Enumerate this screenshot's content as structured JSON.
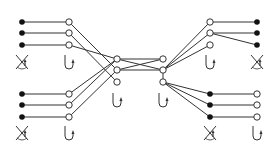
{
  "diagram": {
    "type": "network-graph",
    "colors": {
      "edge": "#333333",
      "filled_node": "#111111",
      "open_node_fill": "#ffffff",
      "open_node_stroke": "#333333",
      "icon": "#333333"
    },
    "nodes": [
      {
        "id": "L1a",
        "x": 22,
        "y": 22,
        "kind": "filled"
      },
      {
        "id": "L1b",
        "x": 22,
        "y": 33,
        "kind": "filled"
      },
      {
        "id": "L1c",
        "x": 22,
        "y": 45,
        "kind": "filled"
      },
      {
        "id": "L2a",
        "x": 69,
        "y": 22,
        "kind": "open"
      },
      {
        "id": "L2b",
        "x": 69,
        "y": 33,
        "kind": "open"
      },
      {
        "id": "L2c",
        "x": 69,
        "y": 45,
        "kind": "open"
      },
      {
        "id": "L3a",
        "x": 22,
        "y": 94,
        "kind": "filled"
      },
      {
        "id": "L3b",
        "x": 22,
        "y": 105,
        "kind": "filled"
      },
      {
        "id": "L3c",
        "x": 22,
        "y": 117,
        "kind": "filled"
      },
      {
        "id": "L4a",
        "x": 69,
        "y": 94,
        "kind": "open"
      },
      {
        "id": "L4b",
        "x": 69,
        "y": 105,
        "kind": "open"
      },
      {
        "id": "L4c",
        "x": 69,
        "y": 117,
        "kind": "open"
      },
      {
        "id": "CLa",
        "x": 117,
        "y": 59,
        "kind": "open"
      },
      {
        "id": "CLb",
        "x": 117,
        "y": 70,
        "kind": "open"
      },
      {
        "id": "CLc",
        "x": 117,
        "y": 82,
        "kind": "open"
      },
      {
        "id": "CRa",
        "x": 163,
        "y": 59,
        "kind": "open"
      },
      {
        "id": "CRb",
        "x": 163,
        "y": 70,
        "kind": "open"
      },
      {
        "id": "CRc",
        "x": 163,
        "y": 82,
        "kind": "open"
      },
      {
        "id": "R1a",
        "x": 210,
        "y": 22,
        "kind": "open"
      },
      {
        "id": "R1b",
        "x": 210,
        "y": 33,
        "kind": "open"
      },
      {
        "id": "R1c",
        "x": 210,
        "y": 45,
        "kind": "open"
      },
      {
        "id": "R2a",
        "x": 257,
        "y": 22,
        "kind": "filled"
      },
      {
        "id": "R2b",
        "x": 257,
        "y": 33,
        "kind": "filled"
      },
      {
        "id": "R2c",
        "x": 257,
        "y": 45,
        "kind": "filled"
      },
      {
        "id": "R3a",
        "x": 210,
        "y": 94,
        "kind": "filled"
      },
      {
        "id": "R3b",
        "x": 210,
        "y": 105,
        "kind": "filled"
      },
      {
        "id": "R3c",
        "x": 210,
        "y": 117,
        "kind": "filled"
      },
      {
        "id": "R4a",
        "x": 257,
        "y": 94,
        "kind": "open"
      },
      {
        "id": "R4b",
        "x": 257,
        "y": 105,
        "kind": "open"
      },
      {
        "id": "R4c",
        "x": 257,
        "y": 117,
        "kind": "open"
      }
    ],
    "edges": [
      [
        "L1a",
        "L2a"
      ],
      [
        "L1b",
        "L2b"
      ],
      [
        "L1c",
        "L2c"
      ],
      [
        "L3a",
        "L4a"
      ],
      [
        "L3b",
        "L4b"
      ],
      [
        "L3c",
        "L4c"
      ],
      [
        "L2a",
        "CLb"
      ],
      [
        "L2b",
        "CLc"
      ],
      [
        "L2c",
        "CLa"
      ],
      [
        "L4a",
        "CLa"
      ],
      [
        "L4b",
        "CLa"
      ],
      [
        "L4c",
        "CLb"
      ],
      [
        "CLa",
        "CRa"
      ],
      [
        "CLa",
        "CRb"
      ],
      [
        "CLb",
        "CRa"
      ],
      [
        "CLb",
        "CRb"
      ],
      [
        "CRb",
        "R1a"
      ],
      [
        "CRb",
        "R1b"
      ],
      [
        "CRb",
        "R1c"
      ],
      [
        "R1a",
        "R2a"
      ],
      [
        "R1b",
        "R2b"
      ],
      [
        "R1b",
        "R2c"
      ],
      [
        "CRc",
        "R3a"
      ],
      [
        "CRc",
        "R3b"
      ],
      [
        "CRc",
        "R3c"
      ],
      [
        "R3a",
        "R4a"
      ],
      [
        "R3b",
        "R4b"
      ],
      [
        "R3c",
        "R4c"
      ],
      [
        "CRb",
        "CRc"
      ]
    ],
    "icons": [
      {
        "name": "crossed-out-icon",
        "x": 22,
        "y": 62
      },
      {
        "name": "hook-return-icon",
        "x": 69,
        "y": 62
      },
      {
        "name": "crossed-out-icon",
        "x": 257,
        "y": 62
      },
      {
        "name": "hook-return-icon",
        "x": 210,
        "y": 62
      },
      {
        "name": "hook-return-icon",
        "x": 117,
        "y": 100
      },
      {
        "name": "hook-return-icon",
        "x": 163,
        "y": 100
      },
      {
        "name": "crossed-out-icon",
        "x": 22,
        "y": 133
      },
      {
        "name": "hook-return-icon",
        "x": 69,
        "y": 133
      },
      {
        "name": "crossed-out-icon",
        "x": 210,
        "y": 133
      },
      {
        "name": "hook-return-icon",
        "x": 257,
        "y": 133
      }
    ]
  }
}
